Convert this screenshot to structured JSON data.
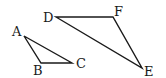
{
  "figure": {
    "triangles": [
      {
        "name": "ABC",
        "vertices": [
          {
            "label": "A",
            "x": 24,
            "y": 36,
            "label_x": 12,
            "label_y": 36
          },
          {
            "label": "B",
            "x": 41,
            "y": 63,
            "label_x": 33,
            "label_y": 75
          },
          {
            "label": "C",
            "x": 72,
            "y": 63,
            "label_x": 76,
            "label_y": 68
          }
        ]
      },
      {
        "name": "DEF",
        "vertices": [
          {
            "label": "D",
            "x": 56,
            "y": 17,
            "label_x": 43,
            "label_y": 22
          },
          {
            "label": "E",
            "x": 142,
            "y": 68,
            "label_x": 144,
            "label_y": 76
          },
          {
            "label": "F",
            "x": 113,
            "y": 17,
            "label_x": 114,
            "label_y": 16
          }
        ]
      }
    ]
  }
}
